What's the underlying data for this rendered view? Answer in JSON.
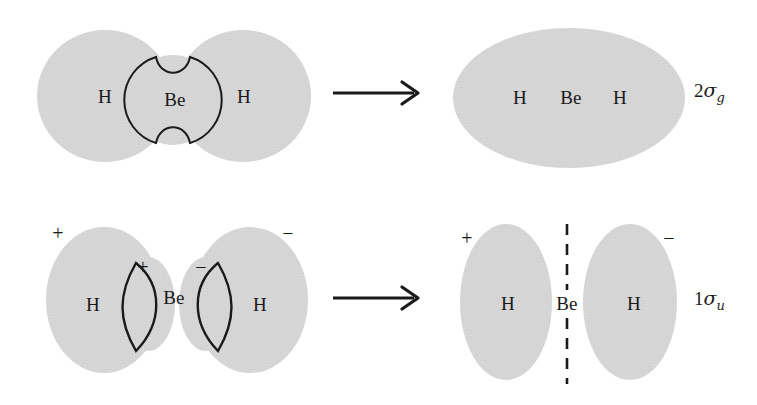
{
  "figure": {
    "background_color": "#ffffff",
    "orbital_fill_color": "#d6d6d6",
    "outline_color": "#1a1a1a"
  },
  "rows": [
    {
      "id": "bonding-row",
      "mo_label_text": "2",
      "mo_label_symbol": "σ",
      "mo_label_subscript": "g",
      "arrow_name": "reaction-arrow-top",
      "left": {
        "lobes": [
          {
            "name": "h-lobe-left",
            "label": "H"
          },
          {
            "name": "be-orbital",
            "label": "Be"
          },
          {
            "name": "h-lobe-right",
            "label": "H"
          }
        ]
      },
      "right": {
        "labels": [
          "H",
          "Be",
          "H"
        ]
      }
    },
    {
      "id": "antibonding-row",
      "mo_label_text": "1",
      "mo_label_symbol": "σ",
      "mo_label_subscript": "u",
      "arrow_name": "reaction-arrow-bottom",
      "left": {
        "lobes": [
          {
            "name": "h-lobe-left",
            "label": "H",
            "outer_sign": "+",
            "inner_sign": "+"
          },
          {
            "name": "be-center-label",
            "label": "Be"
          },
          {
            "name": "h-lobe-right",
            "label": "H",
            "outer_sign": "−",
            "inner_sign": "−"
          }
        ]
      },
      "right": {
        "left_lobe_label": "H",
        "left_lobe_sign": "+",
        "center_label": "Be",
        "right_lobe_label": "H",
        "right_lobe_sign": "−",
        "nodal_plane": "dashed-vertical-line"
      }
    }
  ]
}
